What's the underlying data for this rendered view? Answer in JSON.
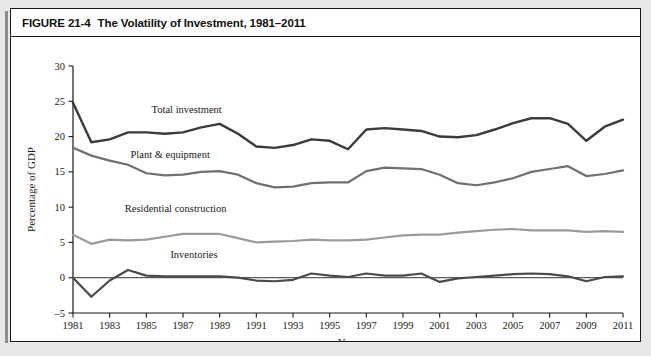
{
  "figure": {
    "number": "FIGURE 21-4",
    "title": "The Volatility of Investment, 1981–2011"
  },
  "chart_data": {
    "type": "line",
    "title": "The Volatility of Investment, 1981–2011",
    "xlabel": "Year",
    "ylabel": "Percentage of GDP",
    "xlim": [
      1981,
      2011
    ],
    "ylim": [
      -5,
      30
    ],
    "ytick_step": 5,
    "xtick_step": 2,
    "grid": false,
    "legend_position": "inline-labels",
    "yticks": [
      -5,
      0,
      5,
      10,
      15,
      20,
      25,
      30
    ],
    "ytick_labels": [
      "–5",
      "0",
      "5",
      "10",
      "15",
      "20",
      "25",
      "30"
    ],
    "xticks": [
      1981,
      1983,
      1985,
      1987,
      1989,
      1991,
      1993,
      1995,
      1997,
      1999,
      2001,
      2003,
      2005,
      2007,
      2009,
      2011
    ],
    "xtick_labels": [
      "1981",
      "1983",
      "1985",
      "1987",
      "1989",
      "1991",
      "1993",
      "1995",
      "1997",
      "1999",
      "2001",
      "2003",
      "2005",
      "2007",
      "2009",
      "2011"
    ],
    "x": [
      1981,
      1982,
      1983,
      1984,
      1985,
      1986,
      1987,
      1988,
      1989,
      1990,
      1991,
      1992,
      1993,
      1994,
      1995,
      1996,
      1997,
      1998,
      1999,
      2000,
      2001,
      2002,
      2003,
      2004,
      2005,
      2006,
      2007,
      2008,
      2009,
      2010,
      2011
    ],
    "series": [
      {
        "name": "Total investment",
        "color": "#3b3b3b",
        "width": 2.4,
        "values": [
          24.8,
          19.2,
          19.6,
          20.6,
          20.6,
          20.4,
          20.6,
          21.3,
          21.8,
          20.4,
          18.6,
          18.4,
          18.8,
          19.6,
          19.4,
          18.2,
          21.0,
          21.2,
          21.0,
          20.8,
          20.0,
          19.9,
          20.2,
          21.0,
          21.9,
          22.6,
          22.6,
          21.8,
          19.4,
          21.4,
          22.4
        ],
        "label_x": 1986,
        "label_y": 23.6
      },
      {
        "name": "Plant & equipment",
        "color": "#707070",
        "width": 2.2,
        "values": [
          18.4,
          17.3,
          16.6,
          16.0,
          14.8,
          14.5,
          14.6,
          15.0,
          15.1,
          14.6,
          13.4,
          12.8,
          12.9,
          13.4,
          13.5,
          13.5,
          15.1,
          15.6,
          15.5,
          15.4,
          14.6,
          13.4,
          13.1,
          13.5,
          14.1,
          15.0,
          15.4,
          15.8,
          14.4,
          14.7,
          15.2
        ],
        "label_x": 1986,
        "label_y": 16.9
      },
      {
        "name": "Residential construction",
        "color": "#9b9b9b",
        "width": 2.2,
        "values": [
          6.1,
          4.8,
          5.4,
          5.3,
          5.4,
          5.8,
          6.2,
          6.2,
          6.2,
          5.6,
          5.0,
          5.1,
          5.2,
          5.4,
          5.3,
          5.3,
          5.4,
          5.7,
          6.0,
          6.1,
          6.1,
          6.4,
          6.6,
          6.8,
          6.9,
          6.7,
          6.7,
          6.7,
          6.5,
          6.6,
          6.5
        ]
      },
      {
        "name": "Inventories",
        "color": "#4a4a4a",
        "width": 2.2,
        "values": [
          0.0,
          -2.7,
          -0.4,
          1.1,
          0.3,
          0.2,
          0.2,
          0.2,
          0.2,
          0.0,
          -0.4,
          -0.5,
          -0.3,
          0.6,
          0.3,
          0.1,
          0.6,
          0.3,
          0.3,
          0.6,
          -0.6,
          -0.1,
          0.1,
          0.3,
          0.5,
          0.6,
          0.5,
          0.2,
          -0.5,
          0.1,
          0.2
        ]
      }
    ],
    "series_label_positions": [
      {
        "name": "Total investment",
        "x": 1987.2,
        "y": 23.4
      },
      {
        "name": "Plant & equipment",
        "x": 1986.3,
        "y": 16.9
      },
      {
        "name": "Residential construction",
        "x": 1986.6,
        "y": 9.3
      },
      {
        "name": "Inventories",
        "x": 1987.6,
        "y": 2.8
      }
    ]
  }
}
